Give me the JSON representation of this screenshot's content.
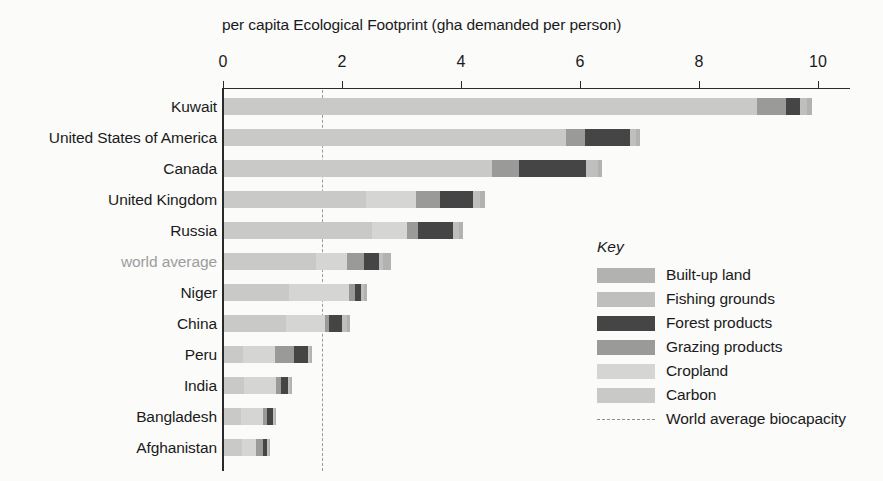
{
  "chart_data": {
    "type": "bar",
    "orientation": "horizontal",
    "stacked": true,
    "title": "per capita Ecological Footprint (gha demanded per person)",
    "xlabel": "per capita Ecological Footprint (gha demanded per person)",
    "ylabel": "",
    "xlim": [
      0,
      10.6
    ],
    "xticks": [
      0,
      2,
      4,
      6,
      8,
      10
    ],
    "xtick_labels": [
      "0",
      "2",
      "4",
      "6",
      "8",
      "10"
    ],
    "grid": false,
    "legend_position": "right-middle",
    "legend_title": "Key",
    "series": [
      {
        "name": "Carbon",
        "color": "#c9c9c7",
        "values": [
          8.95,
          5.75,
          4.5,
          2.38,
          2.48,
          1.55,
          1.1,
          1.05,
          0.32,
          0.33,
          0.28,
          0.3
        ]
      },
      {
        "name": "Cropland",
        "color": "#d5d5d3",
        "values": [
          0.0,
          0.0,
          0.0,
          0.85,
          0.6,
          0.52,
          1.0,
          0.65,
          0.54,
          0.55,
          0.38,
          0.24
        ]
      },
      {
        "name": "Grazing products",
        "color": "#9a9a98",
        "values": [
          0.5,
          0.32,
          0.45,
          0.4,
          0.18,
          0.28,
          0.1,
          0.06,
          0.32,
          0.08,
          0.06,
          0.11
        ]
      },
      {
        "name": "Forest products",
        "color": "#454545",
        "values": [
          0.23,
          0.76,
          1.14,
          0.55,
          0.59,
          0.26,
          0.1,
          0.22,
          0.24,
          0.12,
          0.11,
          0.08
        ]
      },
      {
        "name": "Fishing grounds",
        "color": "#bfbfbd",
        "values": [
          0.12,
          0.1,
          0.2,
          0.12,
          0.1,
          0.07,
          0.05,
          0.08,
          0.03,
          0.03,
          0.02,
          0.02
        ]
      },
      {
        "name": "Built-up land",
        "color": "#b2b2b0",
        "values": [
          0.08,
          0.07,
          0.06,
          0.08,
          0.07,
          0.12,
          0.05,
          0.06,
          0.03,
          0.03,
          0.02,
          0.02
        ]
      }
    ],
    "categories": [
      "Kuwait",
      "United States of America",
      "Canada",
      "United Kingdom",
      "Russia",
      "world average",
      "Niger",
      "China",
      "Peru",
      "India",
      "Bangladesh",
      "Afghanistan"
    ],
    "category_totals": [
      10.22,
      7.0,
      6.35,
      4.38,
      4.02,
      2.8,
      2.4,
      2.12,
      1.48,
      1.14,
      0.87,
      0.77
    ],
    "annotations": [
      {
        "type": "vline",
        "label": "World average biocapacity",
        "value": 1.66,
        "style": "dash-dot",
        "color": "#9a9a9a"
      }
    ],
    "highlighted_category": "world average"
  },
  "axis": {
    "title": "per capita Ecological Footprint (gha demanded per person)",
    "tick_labels": [
      "0",
      "2",
      "4",
      "6",
      "8",
      "10"
    ]
  },
  "legend": {
    "title": "Key",
    "items": [
      {
        "label": "Built-up land",
        "color": "#b2b2b0",
        "kind": "swatch"
      },
      {
        "label": "Fishing grounds",
        "color": "#bfbfbd",
        "kind": "swatch"
      },
      {
        "label": "Forest products",
        "color": "#454545",
        "kind": "swatch"
      },
      {
        "label": "Grazing products",
        "color": "#9a9a98",
        "kind": "swatch"
      },
      {
        "label": "Cropland",
        "color": "#d5d5d3",
        "kind": "swatch"
      },
      {
        "label": "Carbon",
        "color": "#c9c9c7",
        "kind": "swatch"
      },
      {
        "label": "World average biocapacity",
        "color": "#8f8f8f",
        "kind": "dashline"
      }
    ]
  },
  "colors": {
    "background": "#fbfbfa",
    "axis": "#2a2a2a",
    "text": "#1a1a1a",
    "muted_text": "#9d9d9d",
    "biocapacity_line": "#9a9a9a"
  }
}
